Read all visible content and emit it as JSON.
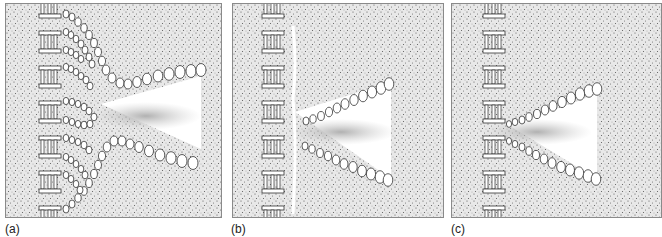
{
  "figure": {
    "panels": [
      {
        "id": "a",
        "label": "(a)",
        "description": "Multiple lipid bilayer tubules converging from stacked grana-like membranes toward a V-shaped opening; stippled background"
      },
      {
        "id": "b",
        "label": "(b)",
        "description": "Membrane boundary detached; two straight lines of vesicles form a V-shaped opening with a fuzzy core"
      },
      {
        "id": "c",
        "label": "(c)",
        "description": "V-shaped vesicle lines connected directly to the stacked membrane column; fuzzy core in the opening"
      }
    ],
    "colors": {
      "background_stipple": "#e6e6e6",
      "dots": "#555555",
      "outline": "#333333",
      "clear_zone": "#ffffff",
      "haze": "#b5b5b5"
    }
  }
}
